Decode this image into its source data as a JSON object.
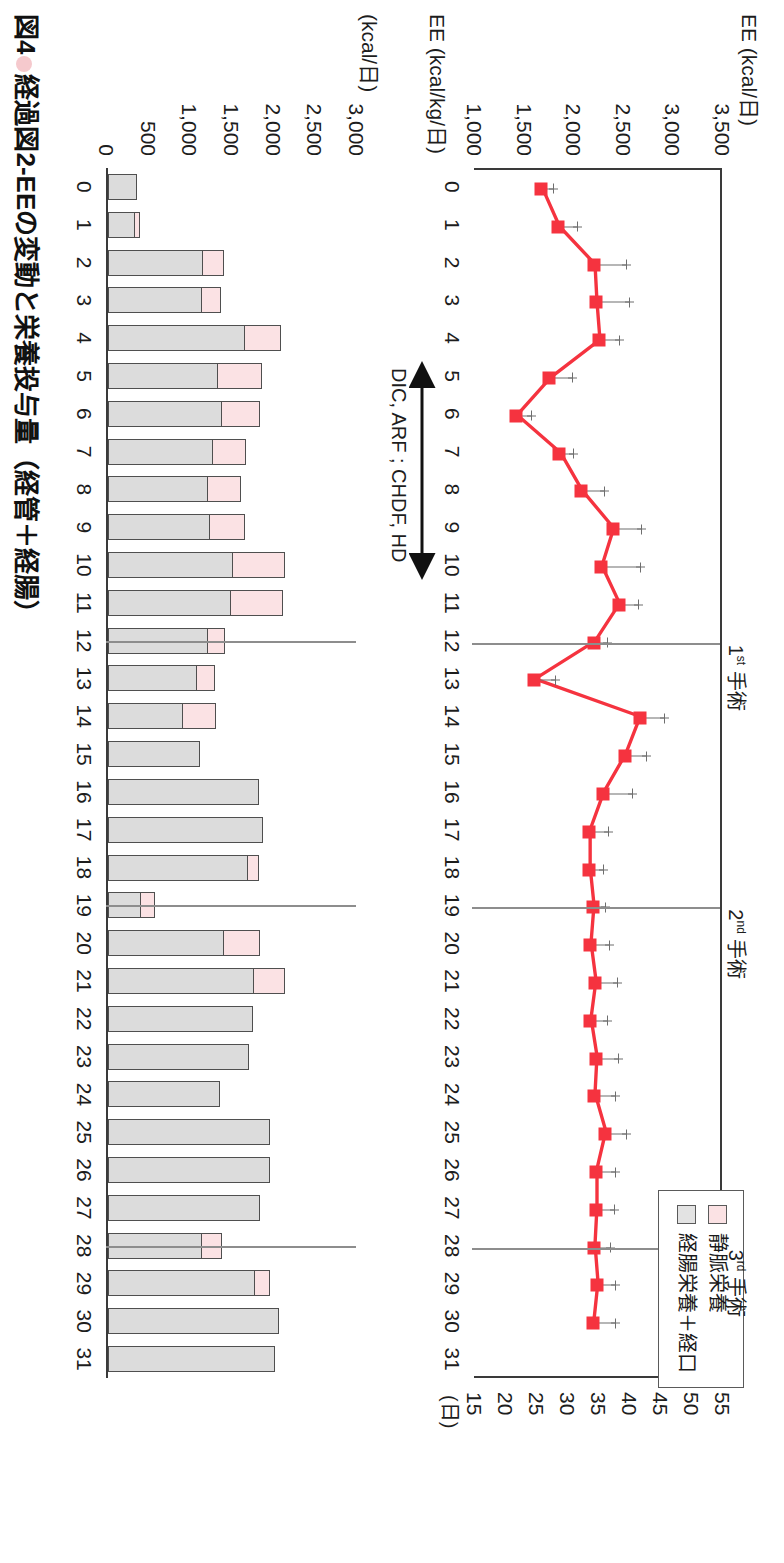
{
  "caption": {
    "figure_number": "図4",
    "text": "経過図2-EEの変動と栄養投与量（経管＋経腸）"
  },
  "legend": {
    "items": [
      {
        "label": "静脈栄養",
        "color": "#fbe2e4",
        "key": "pv"
      },
      {
        "label": "経腸栄養＋経口",
        "color": "#e3e3e3",
        "key": "en"
      }
    ]
  },
  "annotations": {
    "surgeries": [
      {
        "label_sup": "1",
        "label_ord": "st",
        "label_rest": " 手術",
        "day": 12
      },
      {
        "label_sup": "2",
        "label_ord": "nd",
        "label_rest": " 手術",
        "day": 19
      },
      {
        "label_sup": "3",
        "label_ord": "rd",
        "label_rest": " 手術",
        "day": 28
      }
    ],
    "therapy": {
      "text": "DIC, ARF ; CHDF, HD",
      "day_start": 5,
      "day_end": 10
    }
  },
  "chart_data": [
    {
      "type": "line",
      "id": "ee-chart",
      "title": "",
      "ylabel_left": "EE (kcal/日)",
      "ylabel_right": "EE (kcal/kg/日)",
      "xlabel": "(日)",
      "grid": false,
      "legend_position": "none",
      "ylim": [
        1000,
        3500
      ],
      "yticks": [
        "1,000",
        "1,500",
        "2,000",
        "2,500",
        "3,000",
        "3,500"
      ],
      "ytick_values": [
        1000,
        1500,
        2000,
        2500,
        3000,
        3500
      ],
      "ylim_right": [
        15,
        55
      ],
      "yticks_right": [
        "15",
        "20",
        "25",
        "30",
        "35",
        "40",
        "45",
        "50",
        "55"
      ],
      "ytick_values_right": [
        15,
        20,
        25,
        30,
        35,
        40,
        45,
        50,
        55
      ],
      "xlim": [
        0,
        31
      ],
      "x": [
        0,
        1,
        2,
        3,
        4,
        5,
        6,
        7,
        8,
        9,
        10,
        11,
        12,
        13,
        14,
        15,
        16,
        17,
        18,
        19,
        20,
        21,
        22,
        23,
        24,
        25,
        26,
        27,
        28,
        29,
        30
      ],
      "xticks": [
        "0",
        "1",
        "2",
        "3",
        "4",
        "5",
        "6",
        "7",
        "8",
        "9",
        "10",
        "11",
        "12",
        "13",
        "14",
        "15",
        "16",
        "17",
        "18",
        "19",
        "20",
        "21",
        "22",
        "23",
        "24",
        "25",
        "26",
        "27",
        "28",
        "29",
        "30",
        "31"
      ],
      "series": [
        {
          "name": "EE",
          "color": "#f5333f",
          "marker": "square",
          "values": [
            1700,
            1870,
            2230,
            2250,
            2280,
            1780,
            1440,
            1880,
            2100,
            2420,
            2300,
            2480,
            2230,
            1620,
            2690,
            2540,
            2320,
            2180,
            2180,
            2220,
            2190,
            2240,
            2190,
            2250,
            2230,
            2340,
            2250,
            2250,
            2230,
            2260,
            2220
          ],
          "errors": [
            130,
            200,
            330,
            340,
            210,
            240,
            160,
            150,
            240,
            290,
            400,
            200,
            140,
            230,
            260,
            220,
            300,
            200,
            150,
            130,
            200,
            230,
            180,
            230,
            220,
            220,
            200,
            190,
            170,
            190,
            230
          ]
        }
      ]
    },
    {
      "type": "bar",
      "id": "nutrition-chart",
      "subtype": "stacked",
      "ylabel": "(kcal/日)",
      "xlabel": "",
      "grid": false,
      "ylim": [
        0,
        3000
      ],
      "yticks": [
        "0",
        "500",
        "1,000",
        "1,500",
        "2,000",
        "2,500",
        "3,000"
      ],
      "ytick_values": [
        0,
        500,
        1000,
        1500,
        2000,
        2500,
        3000
      ],
      "categories": [
        "0",
        "1",
        "2",
        "3",
        "4",
        "5",
        "6",
        "7",
        "8",
        "9",
        "10",
        "11",
        "12",
        "13",
        "14",
        "15",
        "16",
        "17",
        "18",
        "19",
        "20",
        "21",
        "22",
        "23",
        "24",
        "25",
        "26",
        "27",
        "28",
        "29",
        "30",
        "31"
      ],
      "series": [
        {
          "name": "静脈栄養",
          "key": "pv",
          "color": "#fbe2e4",
          "values": [
            0,
            60,
            250,
            230,
            430,
            530,
            460,
            400,
            400,
            420,
            620,
            620,
            200,
            210,
            400,
            0,
            0,
            0,
            130,
            170,
            430,
            370,
            0,
            0,
            0,
            0,
            0,
            0,
            240,
            180,
            0,
            0
          ]
        },
        {
          "name": "経腸栄養＋経口",
          "key": "en",
          "color": "#dcdcdc",
          "values": [
            350,
            330,
            1140,
            1130,
            1650,
            1320,
            1370,
            1260,
            1200,
            1220,
            1500,
            1480,
            1200,
            1070,
            900,
            1100,
            1810,
            1860,
            1680,
            400,
            1390,
            1750,
            1740,
            1690,
            1350,
            1940,
            1950,
            1830,
            1130,
            1760,
            2050,
            2000
          ]
        }
      ]
    }
  ]
}
